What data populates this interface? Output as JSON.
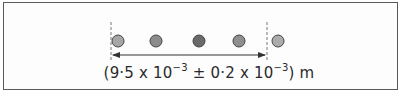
{
  "diagram": {
    "dots": [
      {
        "x": 118,
        "fill": "#a6a6a6"
      },
      {
        "x": 156,
        "fill": "#8c8c8c"
      },
      {
        "x": 199,
        "fill": "#6a6a6a"
      },
      {
        "x": 239,
        "fill": "#8f8f8f"
      },
      {
        "x": 278,
        "fill": "#ababab"
      }
    ],
    "caption": {
      "open": "(9·5 x 10",
      "exp1": "−3",
      "mid": " ± 0·2 x 10",
      "exp2": "−3",
      "close": ") m"
    }
  }
}
